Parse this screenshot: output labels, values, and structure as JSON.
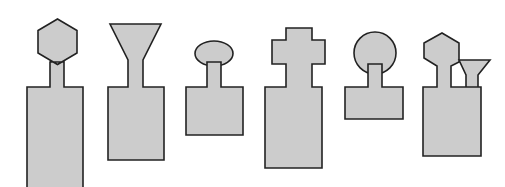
{
  "figure": {
    "title": "Row of six stylized tool silhouettes",
    "canvas": {
      "width": 505,
      "height": 187
    },
    "style": {
      "background_color": "#ffffff",
      "fill_color": "#cccccc",
      "stroke_color": "#222222",
      "stroke_width": 1.6
    },
    "shapes": [
      {
        "index": 1,
        "name": "hexagon-head-tall-body",
        "head_type": "hexagon",
        "neck_count": 1,
        "body_type": "rectangle-tall-cropped",
        "head_bounds": {
          "x": 31,
          "y": 19,
          "width": 53,
          "height": 45
        },
        "neck_bounds": {
          "x": 50,
          "y": 60,
          "width": 14,
          "height": 27
        },
        "body_bounds": {
          "x": 27,
          "y": 87,
          "width": 56,
          "height": 100
        },
        "path": "M 57.5 19 L 77 30.5 L 77 53 L 57.5 64.5 L 38 53 L 38 30.5 Z M 50 62 L 64 62 L 64 87 L 83 87 L 83 191 L 27 191 L 27 87 L 50 87 Z"
      },
      {
        "index": 2,
        "name": "funnel-head-medium-body",
        "head_type": "funnel",
        "neck_count": 1,
        "body_type": "rectangle-medium",
        "head_bounds": {
          "x": 110,
          "y": 24,
          "width": 51,
          "height": 37
        },
        "neck_bounds": {
          "x": 128,
          "y": 61,
          "width": 15,
          "height": 26
        },
        "body_bounds": {
          "x": 108,
          "y": 87,
          "width": 56,
          "height": 73
        },
        "path": "M 110 24 L 161 24 L 143 60 L 143 87 L 164 87 L 164 160 L 108 160 L 108 87 L 128 87 L 128 60 Z"
      },
      {
        "index": 3,
        "name": "ellipse-head-short-body",
        "head_type": "ellipse",
        "neck_count": 1,
        "body_type": "rectangle-short",
        "head_bounds": {
          "x": 195,
          "y": 41,
          "width": 38,
          "height": 25
        },
        "neck_bounds": {
          "x": 207,
          "y": 60,
          "width": 14,
          "height": 27
        },
        "body_bounds": {
          "x": 186,
          "y": 87,
          "width": 57,
          "height": 48
        },
        "path": "M 207 62 L 207 87 L 186 87 L 186 135 L 243 135 L 243 87 L 221 87 L 221 62 Z"
      },
      {
        "index": 4,
        "name": "cross-head-tall-body",
        "head_type": "cross",
        "neck_count": 1,
        "body_type": "rectangle-tall",
        "head_bounds": {
          "x": 272,
          "y": 28,
          "width": 53,
          "height": 36
        },
        "neck_bounds": {
          "x": 286,
          "y": 60,
          "width": 14,
          "height": 27
        },
        "body_bounds": {
          "x": 265,
          "y": 87,
          "width": 57,
          "height": 81
        },
        "path": "M 286 28 L 312 28 L 312 40 L 325 40 L 325 64 L 312 64 L 312 87 L 322 87 L 322 168 L 265 168 L 265 87 L 286 87 L 286 64 L 272 64 L 272 40 L 286 40 Z"
      },
      {
        "index": 5,
        "name": "circle-head-short-body",
        "head_type": "circle",
        "neck_count": 1,
        "body_type": "rectangle-short-wide",
        "head_bounds": {
          "x": 354,
          "y": 32,
          "width": 42,
          "height": 42
        },
        "neck_bounds": {
          "x": 368,
          "y": 66,
          "width": 14,
          "height": 21
        },
        "body_bounds": {
          "x": 345,
          "y": 87,
          "width": 58,
          "height": 32
        },
        "path": "M 368 64 L 368 87 L 345 87 L 345 119 L 403 119 L 403 87 L 382 87 L 382 64 Z"
      },
      {
        "index": 6,
        "name": "hexagon-and-funnel-twin-neck-body",
        "head_type": "hexagon-plus-small-funnel",
        "neck_count": 2,
        "body_type": "rectangle-medium",
        "head_bounds": {
          "x": 424,
          "y": 33,
          "width": 66,
          "height": 45
        },
        "neck_bounds": {
          "x": 437,
          "y": 62,
          "width": 14,
          "height": 25
        },
        "second_neck_bounds": {
          "x": 466,
          "y": 72,
          "width": 12,
          "height": 15
        },
        "body_bounds": {
          "x": 423,
          "y": 87,
          "width": 58,
          "height": 69
        },
        "path": "M 442 33 L 459 43 L 459 62 L 451 66 L 451 87 L 481 87 L 481 156 L 423 156 L 423 87 L 437 87 L 437 66 L 424 58 L 424 43 Z M 459 60 L 490 60 L 478 75 L 478 87 L 466 87 L 466 75 Z"
      }
    ]
  }
}
